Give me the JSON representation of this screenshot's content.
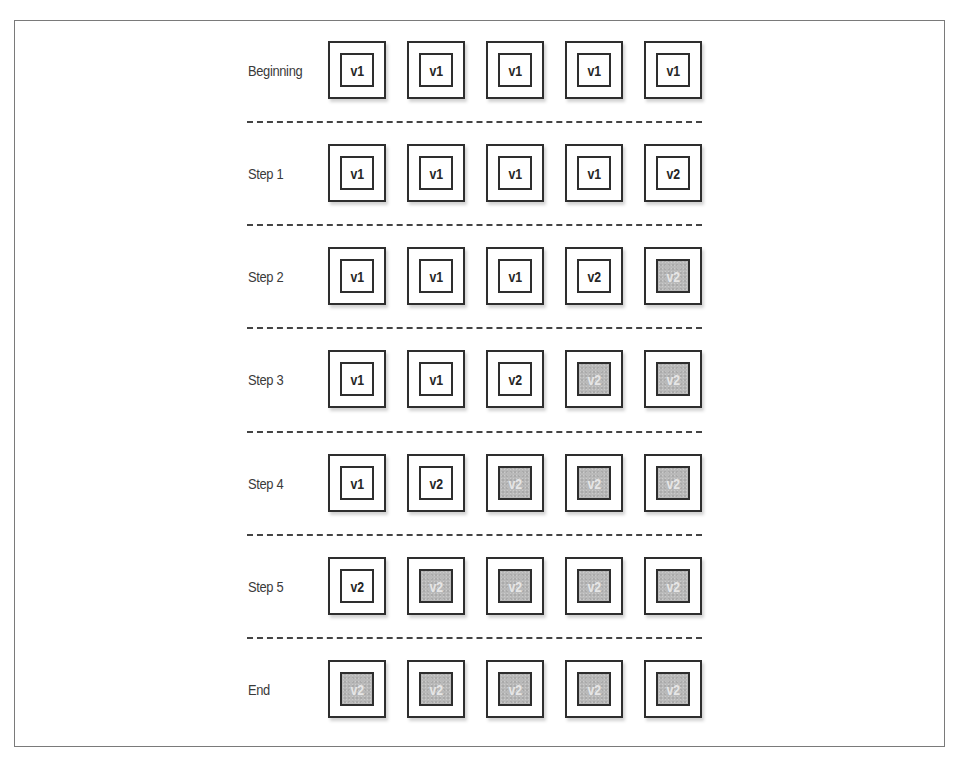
{
  "diagram": {
    "columns": 5,
    "colors": {
      "border": "#2e2e2e",
      "new_version_fill": "#ffffff",
      "settled_v2_fill": "#b9b9b9",
      "settled_v2_text": "#e6e6e6",
      "divider": "#444444",
      "frame": "#7a7a7a"
    },
    "rows": [
      {
        "label": "Beginning",
        "nodes": [
          {
            "version": "v1",
            "state": "current"
          },
          {
            "version": "v1",
            "state": "current"
          },
          {
            "version": "v1",
            "state": "current"
          },
          {
            "version": "v1",
            "state": "current"
          },
          {
            "version": "v1",
            "state": "current"
          }
        ]
      },
      {
        "label": "Step 1",
        "nodes": [
          {
            "version": "v1",
            "state": "current"
          },
          {
            "version": "v1",
            "state": "current"
          },
          {
            "version": "v1",
            "state": "current"
          },
          {
            "version": "v1",
            "state": "current"
          },
          {
            "version": "v2",
            "state": "current"
          }
        ]
      },
      {
        "label": "Step 2",
        "nodes": [
          {
            "version": "v1",
            "state": "current"
          },
          {
            "version": "v1",
            "state": "current"
          },
          {
            "version": "v1",
            "state": "current"
          },
          {
            "version": "v2",
            "state": "current"
          },
          {
            "version": "v2",
            "state": "settled"
          }
        ]
      },
      {
        "label": "Step 3",
        "nodes": [
          {
            "version": "v1",
            "state": "current"
          },
          {
            "version": "v1",
            "state": "current"
          },
          {
            "version": "v2",
            "state": "current"
          },
          {
            "version": "v2",
            "state": "settled"
          },
          {
            "version": "v2",
            "state": "settled"
          }
        ]
      },
      {
        "label": "Step 4",
        "nodes": [
          {
            "version": "v1",
            "state": "current"
          },
          {
            "version": "v2",
            "state": "current"
          },
          {
            "version": "v2",
            "state": "settled"
          },
          {
            "version": "v2",
            "state": "settled"
          },
          {
            "version": "v2",
            "state": "settled"
          }
        ]
      },
      {
        "label": "Step 5",
        "nodes": [
          {
            "version": "v2",
            "state": "current"
          },
          {
            "version": "v2",
            "state": "settled"
          },
          {
            "version": "v2",
            "state": "settled"
          },
          {
            "version": "v2",
            "state": "settled"
          },
          {
            "version": "v2",
            "state": "settled"
          }
        ]
      },
      {
        "label": "End",
        "nodes": [
          {
            "version": "v2",
            "state": "settled"
          },
          {
            "version": "v2",
            "state": "settled"
          },
          {
            "version": "v2",
            "state": "settled"
          },
          {
            "version": "v2",
            "state": "settled"
          },
          {
            "version": "v2",
            "state": "settled"
          }
        ]
      }
    ]
  }
}
